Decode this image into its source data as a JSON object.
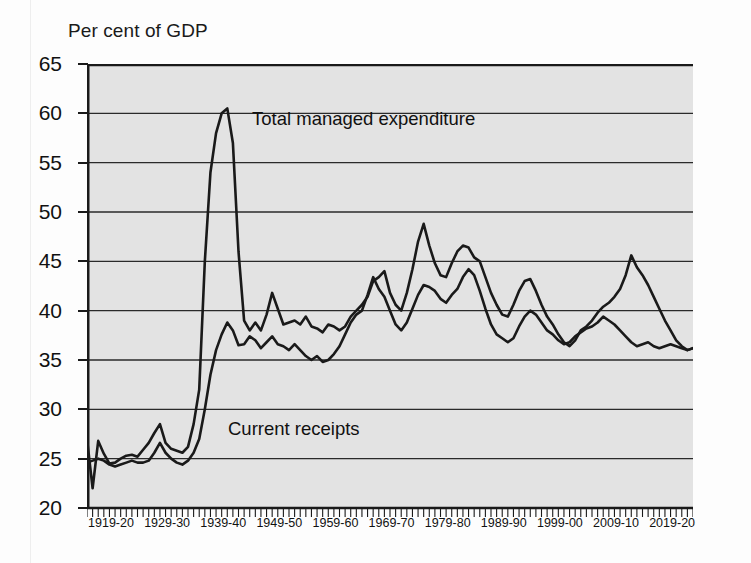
{
  "chart_data": {
    "type": "line",
    "title": "",
    "ylabel": "Per cent of GDP",
    "xlabel": "",
    "ylim": [
      20,
      65
    ],
    "yticks": [
      20,
      25,
      30,
      35,
      40,
      45,
      50,
      55,
      60,
      65
    ],
    "grid": "horizontal",
    "legend_position": "inline-annotation",
    "x_start_year": 1919,
    "x_end_year": 2020,
    "xtick_labels": [
      "1919-20",
      "1929-30",
      "1939-40",
      "1949-50",
      "1959-60",
      "1969-70",
      "1979-80",
      "1989-90",
      "1999-00",
      "2009-10",
      "2019-20"
    ],
    "xtick_years": [
      1919,
      1929,
      1939,
      1949,
      1959,
      1969,
      1979,
      1989,
      1999,
      2009,
      2019
    ],
    "plot_background": "#e3e3e3",
    "line_color": "#1a1a1a",
    "series": [
      {
        "name": "Total managed expenditure",
        "values": [
          27.0,
          22.0,
          26.8,
          25.5,
          24.5,
          24.6,
          25.0,
          25.3,
          25.4,
          25.2,
          25.9,
          26.6,
          27.6,
          28.5,
          26.6,
          26.0,
          25.8,
          25.6,
          26.2,
          28.5,
          32.0,
          45.0,
          54.0,
          58.0,
          60.0,
          60.5,
          57.0,
          46.0,
          39.0,
          38.0,
          38.8,
          38.0,
          39.6,
          41.8,
          40.2,
          38.6,
          38.8,
          39.0,
          38.6,
          39.4,
          38.4,
          38.2,
          37.8,
          38.6,
          38.4,
          38.0,
          38.4,
          39.4,
          40.0,
          40.6,
          41.4,
          43.0,
          43.4,
          44.0,
          41.8,
          40.6,
          40.0,
          41.8,
          44.2,
          47.0,
          48.8,
          46.6,
          44.8,
          43.6,
          43.4,
          44.8,
          46.0,
          46.6,
          46.4,
          45.4,
          45.0,
          43.4,
          41.8,
          40.6,
          39.6,
          39.4,
          40.6,
          42.0,
          43.0,
          43.2,
          42.0,
          40.6,
          39.4,
          38.6,
          37.6,
          36.8,
          36.4,
          37.0,
          38.0,
          38.4,
          39.0,
          39.8,
          40.4,
          40.8,
          41.4,
          42.2,
          43.6,
          45.6,
          44.4,
          43.6,
          42.6,
          41.4,
          40.2,
          39.0,
          38.0,
          37.0,
          36.4,
          36.0,
          36.2
        ]
      },
      {
        "name": "Current receipts",
        "values": [
          24.6,
          24.8,
          25.0,
          24.8,
          24.4,
          24.2,
          24.4,
          24.6,
          24.8,
          24.6,
          24.6,
          24.8,
          25.6,
          26.6,
          25.6,
          25.0,
          24.6,
          24.4,
          24.8,
          25.6,
          27.0,
          30.0,
          33.5,
          36.0,
          37.6,
          38.8,
          38.0,
          36.5,
          36.6,
          37.4,
          37.0,
          36.2,
          36.8,
          37.4,
          36.6,
          36.4,
          36.0,
          36.6,
          36.0,
          35.4,
          35.0,
          35.4,
          34.8,
          35.0,
          35.6,
          36.4,
          37.6,
          38.8,
          39.6,
          40.0,
          41.6,
          43.4,
          42.2,
          41.4,
          40.0,
          38.6,
          38.0,
          38.8,
          40.2,
          41.6,
          42.6,
          42.4,
          42.0,
          41.2,
          40.8,
          41.6,
          42.2,
          43.4,
          44.2,
          43.6,
          42.0,
          40.2,
          38.6,
          37.6,
          37.2,
          36.8,
          37.2,
          38.4,
          39.4,
          40.0,
          39.6,
          38.8,
          38.0,
          37.6,
          37.0,
          36.6,
          36.8,
          37.4,
          37.8,
          38.2,
          38.4,
          38.8,
          39.4,
          39.0,
          38.6,
          38.0,
          37.4,
          36.8,
          36.4,
          36.6,
          36.8,
          36.4,
          36.2,
          36.4,
          36.6,
          36.4,
          36.2,
          36.0,
          36.2
        ]
      }
    ],
    "annotations": [
      {
        "text": "Total managed expenditure",
        "series": "Total managed expenditure"
      },
      {
        "text": "Current receipts",
        "series": "Current receipts"
      }
    ]
  }
}
